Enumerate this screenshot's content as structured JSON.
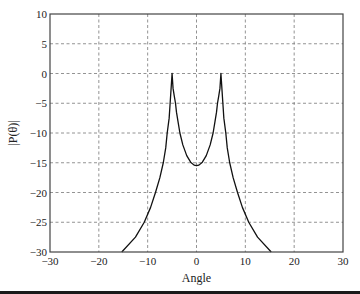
{
  "chart_data": {
    "type": "line",
    "title": "",
    "xlabel": "Angle",
    "ylabel": "|P(θ)|",
    "xlim": [
      -30,
      30
    ],
    "ylim": [
      -30,
      10
    ],
    "xticks": [
      -30,
      -20,
      -10,
      0,
      10,
      20,
      30
    ],
    "yticks": [
      10,
      5,
      0,
      -5,
      -10,
      -15,
      -20,
      -25,
      -30
    ],
    "xtick_labels": [
      "−30",
      "−20",
      "−10",
      "0",
      "10",
      "20",
      "30"
    ],
    "ytick_labels": [
      "10",
      "5",
      "0",
      "−5",
      "−10",
      "−15",
      "−20",
      "−25",
      "−30"
    ],
    "grid": true,
    "legend": null,
    "series": [
      {
        "name": "|P(θ)|",
        "color": "#111111",
        "x": [
          -15.3,
          -12.5,
          -10.7,
          -9.4,
          -8.4,
          -7.5,
          -6.8,
          -6.3,
          -6.0,
          -5.6,
          -5.4,
          -5.2,
          -5.0,
          -4.8,
          -4.55,
          -4.3,
          -4.1,
          -3.8,
          -3.4,
          -2.8,
          -2.0,
          -1.2,
          -0.5,
          0,
          0.5,
          1.2,
          2.0,
          2.8,
          3.4,
          3.8,
          4.1,
          4.3,
          4.55,
          4.8,
          5.0,
          5.2,
          5.4,
          5.6,
          6.0,
          6.3,
          6.8,
          7.5,
          8.4,
          9.4,
          10.7,
          12.5,
          15.3
        ],
        "y": [
          -30,
          -27.5,
          -25,
          -22.5,
          -20,
          -17.5,
          -15,
          -12.5,
          -10,
          -7.5,
          -5,
          -2.5,
          0,
          -2.5,
          -3.8,
          -5,
          -6.5,
          -8,
          -10,
          -12,
          -13.8,
          -14.9,
          -15.4,
          -15.5,
          -15.4,
          -14.9,
          -13.8,
          -12,
          -10,
          -8,
          -6.5,
          -5,
          -3.8,
          -2.5,
          0,
          -2.5,
          -5,
          -7.5,
          -10,
          -12.5,
          -15,
          -17.5,
          -20,
          -22.5,
          -25,
          -27.5,
          -30
        ]
      }
    ]
  }
}
